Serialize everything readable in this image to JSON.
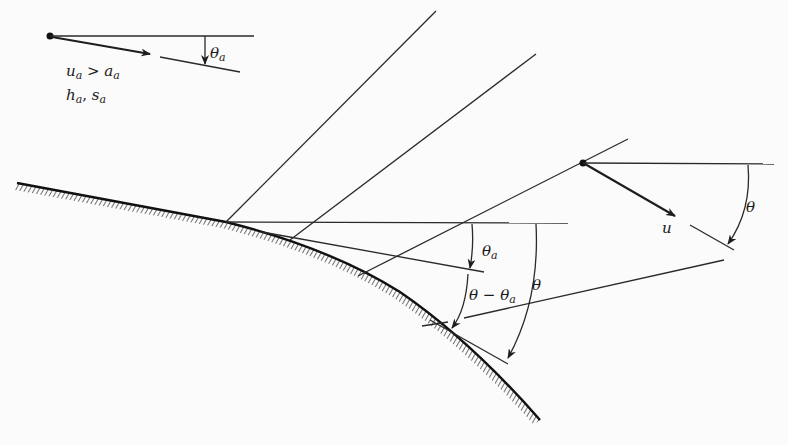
{
  "figure": {
    "type": "Prandtl-Meyer expansion around convex wall",
    "colors": {
      "ink": "#222222",
      "background": "#fbfbfb"
    }
  },
  "upstream_state": {
    "angle_label": "θ",
    "angle_sub": "a",
    "cond_line1_u": "u",
    "cond_line1_u_sub": "a",
    "cond_line1_op": " > ",
    "cond_line1_a": "a",
    "cond_line1_a_sub": "a",
    "cond_line2_h": "h",
    "cond_line2_h_sub": "a",
    "cond_line2_sep": ", ",
    "cond_line2_s": "s",
    "cond_line2_s_sub": "a"
  },
  "local_state": {
    "velocity_label": "u",
    "angle_label": "θ"
  },
  "wall_angles": {
    "theta_a": "θ",
    "theta_a_sub": "a",
    "theta_minus_a_main": "θ − θ",
    "theta_minus_a_sub": "a",
    "theta": "θ"
  }
}
